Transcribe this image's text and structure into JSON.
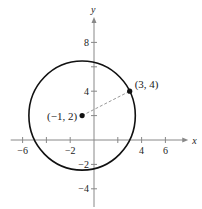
{
  "chart_data": {
    "type": "scatter",
    "title": "",
    "xlabel": "x",
    "ylabel": "y",
    "xlim": [
      -7,
      7.5
    ],
    "ylim": [
      -5,
      10
    ],
    "x_ticks": [
      -6,
      -4,
      -2,
      2,
      4,
      6
    ],
    "x_tick_labels": [
      {
        "value": -6,
        "label": "−6"
      },
      {
        "value": -2,
        "label": "−2"
      },
      {
        "value": 4,
        "label": "4"
      },
      {
        "value": 6,
        "label": "6"
      }
    ],
    "y_ticks": [
      -4,
      -2,
      2,
      4,
      6,
      8
    ],
    "y_tick_labels": [
      {
        "value": -4,
        "label": "−4"
      },
      {
        "value": -2,
        "label": "−2"
      },
      {
        "value": 4,
        "label": "4"
      },
      {
        "value": 8,
        "label": "8"
      }
    ],
    "grid": false,
    "circle": {
      "center": [
        -1,
        2
      ],
      "through": [
        3,
        4
      ],
      "radius": 4.472
    },
    "points": [
      {
        "x": -1,
        "y": 2,
        "label": "(−1, 2)"
      },
      {
        "x": 3,
        "y": 4,
        "label": "(3, 4)"
      }
    ],
    "segments": [
      {
        "from": [
          -1,
          2
        ],
        "to": [
          3,
          4
        ],
        "style": "dashed"
      }
    ]
  }
}
